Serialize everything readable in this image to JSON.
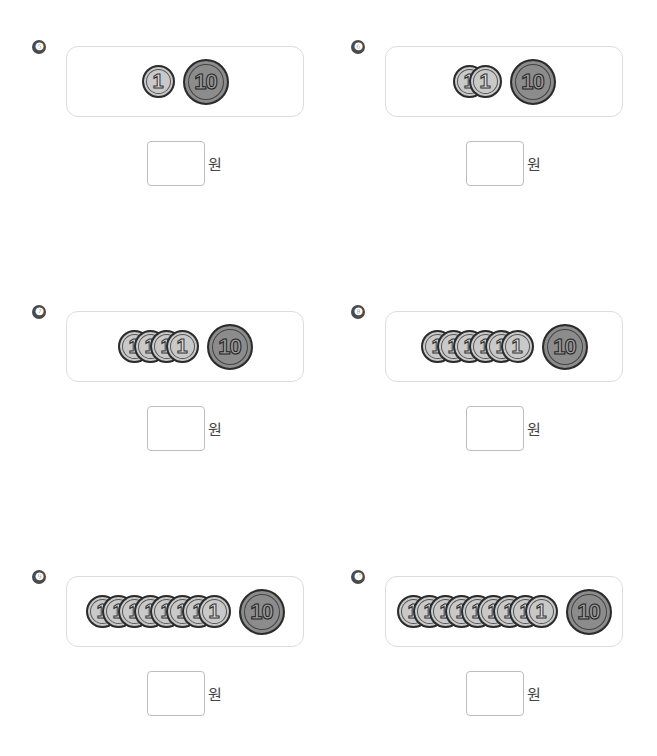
{
  "unit_label": "원",
  "problems": [
    {
      "number": "❺",
      "one_won_count": 1,
      "ten_won_count": 1,
      "one_label": "1",
      "ten_label": "10",
      "answer": ""
    },
    {
      "number": "❻",
      "one_won_count": 2,
      "ten_won_count": 1,
      "one_label": "1",
      "ten_label": "10",
      "answer": ""
    },
    {
      "number": "❼",
      "one_won_count": 4,
      "ten_won_count": 1,
      "one_label": "1",
      "ten_label": "10",
      "answer": ""
    },
    {
      "number": "❽",
      "one_won_count": 6,
      "ten_won_count": 1,
      "one_label": "1",
      "ten_label": "10",
      "answer": ""
    },
    {
      "number": "❾",
      "one_won_count": 8,
      "ten_won_count": 1,
      "one_label": "1",
      "ten_label": "10",
      "answer": ""
    },
    {
      "number": "❿",
      "one_won_count": 9,
      "ten_won_count": 1,
      "one_label": "1",
      "ten_label": "10",
      "answer": ""
    }
  ],
  "colors": {
    "one_won_coin": "#c9c9c9",
    "ten_won_coin": "#8c8c8c",
    "outline": "#2b2b2b",
    "panel_border": "#dcdcdc",
    "badge": "#4a4a4a"
  }
}
